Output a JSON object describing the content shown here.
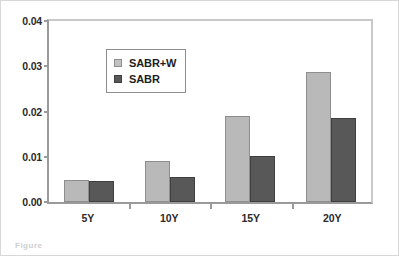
{
  "chart_data": {
    "type": "bar",
    "title": "",
    "subtitle": "",
    "xlabel": "",
    "ylabel": "",
    "categories": [
      "5Y",
      "10Y",
      "15Y",
      "20Y"
    ],
    "series": [
      {
        "name": "SABR+W",
        "color": "#b9b9b9",
        "values": [
          0.0049,
          0.009,
          0.0189,
          0.0287
        ]
      },
      {
        "name": "SABR",
        "color": "#585858",
        "values": [
          0.0047,
          0.0056,
          0.0101,
          0.0185
        ]
      }
    ],
    "ylim": [
      0,
      0.04
    ],
    "yticks": [
      "0.00",
      "0.01",
      "0.02",
      "0.03",
      "0.04"
    ],
    "ytick_values": [
      0,
      0.01,
      0.02,
      0.03,
      0.04
    ],
    "grid": false,
    "legend_position": "top-left",
    "legend_entries": [
      "SABR+W",
      "SABR"
    ]
  },
  "caption": {
    "text": "Figure"
  }
}
